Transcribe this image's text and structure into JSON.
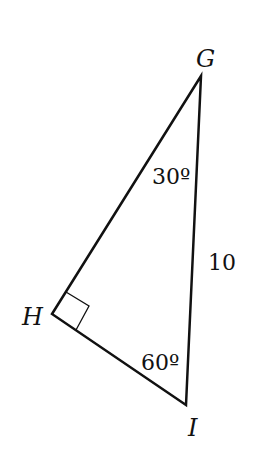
{
  "diagram": {
    "type": "right-triangle",
    "vertices": {
      "G": {
        "label": "G",
        "x": 201,
        "y": 76
      },
      "H": {
        "label": "H",
        "x": 52,
        "y": 314
      },
      "I": {
        "label": "I",
        "x": 186,
        "y": 405
      }
    },
    "right_angle_at": "H",
    "angles": {
      "G": "30º",
      "I": "60º"
    },
    "sides": {
      "GI": "10"
    },
    "colors": {
      "stroke": "#111111",
      "background": "#ffffff"
    }
  }
}
